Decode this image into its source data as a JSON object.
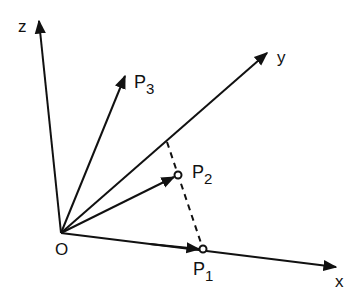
{
  "diagram": {
    "axes": {
      "z": {
        "label": "z"
      },
      "y": {
        "label": "y"
      },
      "x": {
        "label": "x"
      }
    },
    "origin": {
      "label": "O"
    },
    "points": {
      "p1": {
        "label": "P",
        "sub": "1"
      },
      "p2": {
        "label": "P",
        "sub": "2"
      },
      "p3": {
        "label": "P",
        "sub": "3"
      }
    },
    "colors": {
      "line": "#111111",
      "background": "#ffffff"
    }
  }
}
